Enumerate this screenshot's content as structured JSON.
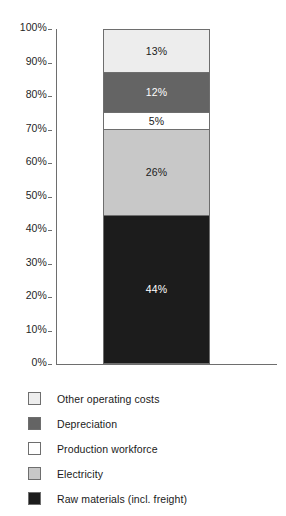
{
  "chart_data": {
    "type": "bar",
    "subtype": "stacked-bar-100",
    "title": "",
    "xlabel": "",
    "ylabel": "",
    "ylim": [
      0,
      100
    ],
    "grid": false,
    "legend_position": "bottom",
    "categories": [
      ""
    ],
    "y_ticks": [
      "0%",
      "10%",
      "20%",
      "30%",
      "40%",
      "50%",
      "60%",
      "70%",
      "80%",
      "90%",
      "100%"
    ],
    "y_tick_values": [
      0,
      10,
      20,
      30,
      40,
      50,
      60,
      70,
      80,
      90,
      100
    ],
    "series": [
      {
        "name": "Other operating costs",
        "values": [
          13
        ],
        "data_label": "13%",
        "color": "#ededed",
        "label_color": "#1a1a1a"
      },
      {
        "name": "Depreciation",
        "values": [
          12
        ],
        "data_label": "12%",
        "color": "#646464",
        "label_color": "#ffffff"
      },
      {
        "name": "Production workforce",
        "values": [
          5
        ],
        "data_label": "5%",
        "color": "#ffffff",
        "label_color": "#1a1a1a"
      },
      {
        "name": "Electricity",
        "values": [
          26
        ],
        "data_label": "26%",
        "color": "#c8c8c8",
        "label_color": "#1a1a1a"
      },
      {
        "name": "Raw materials (incl. freight)",
        "values": [
          44
        ],
        "data_label": "44%",
        "color": "#1c1c1c",
        "label_color": "#ffffff"
      }
    ]
  },
  "axis": {
    "ticks": [
      {
        "label": "100%",
        "value": 100
      },
      {
        "label": "90%",
        "value": 90
      },
      {
        "label": "80%",
        "value": 80
      },
      {
        "label": "70%",
        "value": 70
      },
      {
        "label": "60%",
        "value": 60
      },
      {
        "label": "50%",
        "value": 50
      },
      {
        "label": "40%",
        "value": 40
      },
      {
        "label": "30%",
        "value": 30
      },
      {
        "label": "20%",
        "value": 20
      },
      {
        "label": "10%",
        "value": 10
      },
      {
        "label": "0%",
        "value": 0
      }
    ]
  },
  "legend": {
    "items": [
      {
        "label": "Other operating costs",
        "color": "#ededed"
      },
      {
        "label": "Depreciation",
        "color": "#646464"
      },
      {
        "label": "Production workforce",
        "color": "#ffffff"
      },
      {
        "label": "Electricity",
        "color": "#c8c8c8"
      },
      {
        "label": "Raw materials (incl. freight)",
        "color": "#1c1c1c"
      }
    ]
  },
  "colors": {
    "axis": "#6e6e6e",
    "text": "#1a1a1a",
    "background": "#ffffff"
  }
}
